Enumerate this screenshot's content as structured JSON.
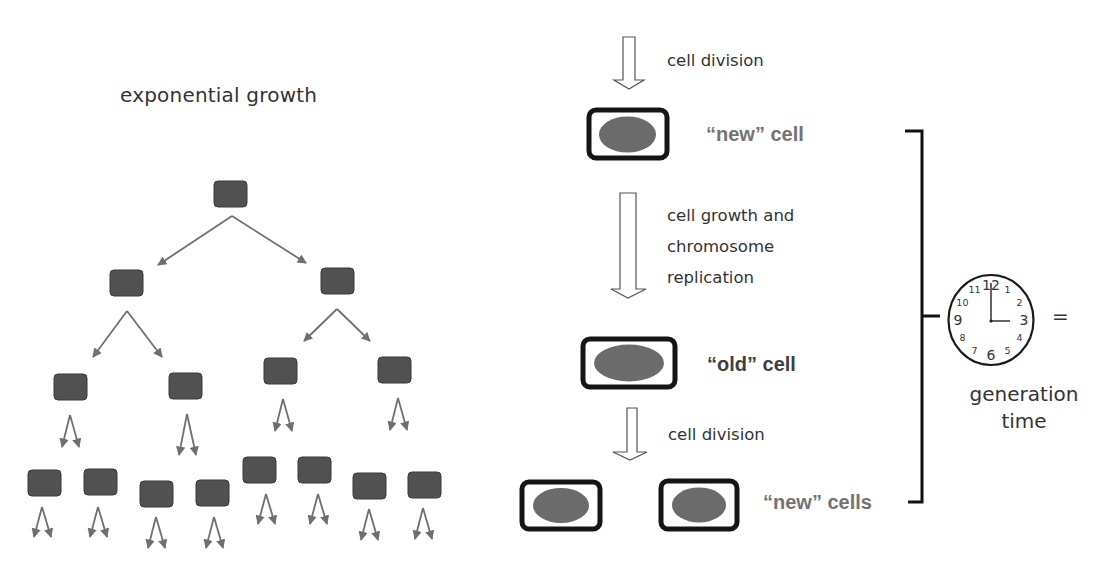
{
  "left_panel": {
    "title": "exponential growth",
    "box_color": "#515151",
    "box_border": "#3a3a3a",
    "arrow_color": "#6f6f6f",
    "generations": [
      {
        "level": 1,
        "cells": [
          {
            "x": 214,
            "y": 181
          }
        ]
      },
      {
        "level": 2,
        "cells": [
          {
            "x": 110,
            "y": 270
          },
          {
            "x": 321,
            "y": 268
          }
        ]
      },
      {
        "level": 3,
        "cells": [
          {
            "x": 54,
            "y": 374
          },
          {
            "x": 169,
            "y": 373
          },
          {
            "x": 264,
            "y": 358
          },
          {
            "x": 378,
            "y": 357
          }
        ]
      },
      {
        "level": 4,
        "cells": [
          {
            "x": 28,
            "y": 470
          },
          {
            "x": 84,
            "y": 469
          },
          {
            "x": 140,
            "y": 481
          },
          {
            "x": 196,
            "y": 480
          },
          {
            "x": 243,
            "y": 457
          },
          {
            "x": 298,
            "y": 457
          },
          {
            "x": 353,
            "y": 473
          },
          {
            "x": 408,
            "y": 472
          }
        ]
      }
    ]
  },
  "cycle_panel": {
    "steps": [
      {
        "label": "cell division"
      },
      {
        "label_lines": [
          "cell growth and",
          "chromosome",
          "replication"
        ]
      },
      {
        "label": "cell division"
      }
    ],
    "cells": {
      "new_cell": "“new” cell",
      "old_cell": "“old” cell",
      "new_cells": "“new” cells"
    },
    "colors": {
      "new_label": "#737373",
      "old_label": "#3f3f3f",
      "nucleus": "#6b6b6b",
      "cell_wall": "#151515"
    }
  },
  "generation_panel": {
    "equals": "=",
    "label_line1": "generation",
    "label_line2": "time",
    "clock": {
      "numbers": [
        "12",
        "1",
        "2",
        "3",
        "4",
        "5",
        "6",
        "7",
        "8",
        "9",
        "10",
        "11"
      ],
      "hour_hand": "3",
      "minute_hand": "12",
      "time_shown": "3:00"
    }
  }
}
